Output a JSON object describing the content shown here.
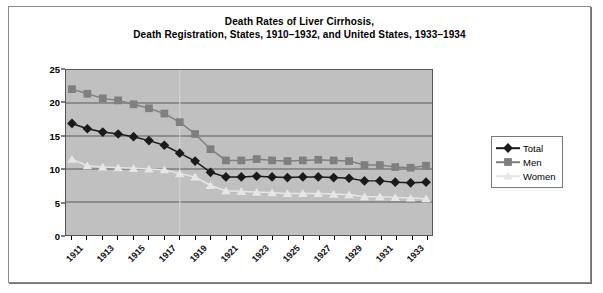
{
  "chart_data": {
    "type": "line",
    "title": "Death Rates of Liver Cirrhosis,\nDeath Registration, States, 1910–1932, and United States, 1933–1934",
    "title_line1": "Death Rates of Liver Cirrhosis,",
    "title_line2": "Death Registration, States, 1910–1932, and United States, 1933–1934",
    "xlabel": "",
    "ylabel": "Rate per 100,000 Population",
    "ylim": [
      0,
      25
    ],
    "yticks": [
      0,
      5,
      10,
      15,
      20,
      25
    ],
    "grid": true,
    "grid_axis": "y",
    "legend_position": "right",
    "plot_background": "#c0c0c0",
    "x": [
      1911,
      1912,
      1913,
      1914,
      1915,
      1916,
      1917,
      1918,
      1919,
      1920,
      1921,
      1922,
      1923,
      1924,
      1925,
      1926,
      1927,
      1928,
      1929,
      1930,
      1931,
      1932,
      1933,
      1934
    ],
    "xtick_labels": [
      "1911",
      "1913",
      "1915",
      "1917",
      "1919",
      "1921",
      "1923",
      "1925",
      "1927",
      "1929",
      "1931",
      "1933"
    ],
    "xticks": [
      1911,
      1913,
      1915,
      1917,
      1919,
      1921,
      1923,
      1925,
      1927,
      1929,
      1931,
      1933
    ],
    "series": [
      {
        "name": "Total",
        "color": "#1a1a1a",
        "marker": "diamond",
        "values": [
          16.9,
          16.1,
          15.6,
          15.3,
          14.9,
          14.3,
          13.6,
          12.4,
          11.2,
          9.5,
          8.8,
          8.8,
          8.9,
          8.8,
          8.7,
          8.8,
          8.8,
          8.7,
          8.6,
          8.2,
          8.2,
          8.0,
          7.9,
          8.0
        ]
      },
      {
        "name": "Men",
        "color": "#7f7f7f",
        "marker": "square",
        "values": [
          22.1,
          21.4,
          20.7,
          20.4,
          19.8,
          19.2,
          18.4,
          17.1,
          15.3,
          13.0,
          11.3,
          11.3,
          11.5,
          11.3,
          11.2,
          11.3,
          11.4,
          11.3,
          11.2,
          10.6,
          10.6,
          10.3,
          10.2,
          10.5
        ]
      },
      {
        "name": "Women",
        "color": "#e6e6e6",
        "marker": "triangle",
        "values": [
          11.5,
          10.5,
          10.3,
          10.2,
          10.1,
          10.0,
          9.9,
          9.3,
          8.8,
          7.5,
          6.7,
          6.6,
          6.5,
          6.4,
          6.3,
          6.3,
          6.3,
          6.2,
          6.1,
          5.8,
          5.8,
          5.7,
          5.6,
          5.5
        ]
      }
    ]
  },
  "legend": {
    "items": [
      {
        "label": "Total"
      },
      {
        "label": "Men"
      },
      {
        "label": "Women"
      }
    ]
  }
}
